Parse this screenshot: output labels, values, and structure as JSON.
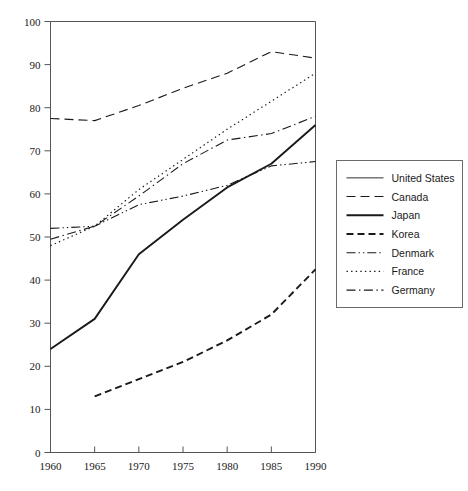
{
  "chart_data": {
    "type": "line",
    "title": "",
    "xlabel": "",
    "ylabel": "",
    "x": [
      1960,
      1965,
      1970,
      1975,
      1980,
      1985,
      1990
    ],
    "xticklabels": [
      "1960",
      "1965",
      "1970",
      "1975",
      "1980",
      "1985",
      "1990"
    ],
    "yticklabels": [
      "0",
      "10",
      "20",
      "30",
      "40",
      "50",
      "60",
      "70",
      "80",
      "90",
      "100"
    ],
    "yticks": [
      0,
      10,
      20,
      30,
      40,
      50,
      60,
      70,
      80,
      90,
      100
    ],
    "xlim": [
      1960,
      1990
    ],
    "ylim": [
      0,
      100
    ],
    "grid": false,
    "legend_position": "right",
    "series": [
      {
        "name": "United States",
        "style": "solid-thin",
        "values": [
          null,
          null,
          null,
          null,
          null,
          null,
          null
        ]
      },
      {
        "name": "Canada",
        "style": "long-dash",
        "values": [
          77.5,
          77.0,
          80.5,
          84.5,
          88.0,
          93.0,
          91.5
        ]
      },
      {
        "name": "Japan",
        "style": "solid-thick",
        "values": [
          24.0,
          31.0,
          46.0,
          54.0,
          61.5,
          67.0,
          76.0
        ]
      },
      {
        "name": "Korea",
        "style": "dash-bold",
        "values": [
          null,
          13.0,
          17.0,
          21.0,
          26.0,
          32.0,
          42.5
        ]
      },
      {
        "name": "Denmark",
        "style": "dash-dot-dot",
        "values": [
          52.0,
          52.5,
          57.5,
          59.5,
          62.0,
          66.5,
          67.5
        ]
      },
      {
        "name": "France",
        "style": "dotted",
        "values": [
          48.0,
          52.5,
          61.0,
          68.0,
          75.0,
          81.5,
          88.0
        ]
      },
      {
        "name": "Germany",
        "style": "dash-dot",
        "values": [
          49.5,
          52.5,
          59.5,
          67.0,
          72.5,
          74.0,
          78.0
        ]
      }
    ]
  },
  "legend": {
    "items": [
      {
        "label": "United States"
      },
      {
        "label": "Canada"
      },
      {
        "label": "Japan"
      },
      {
        "label": "Korea"
      },
      {
        "label": "Denmark"
      },
      {
        "label": "France"
      },
      {
        "label": "Germany"
      }
    ]
  },
  "colors": {
    "line": "#1a1a1a",
    "axis": "#555555",
    "legend_border": "#6a6a6a",
    "background": "#ffffff"
  }
}
